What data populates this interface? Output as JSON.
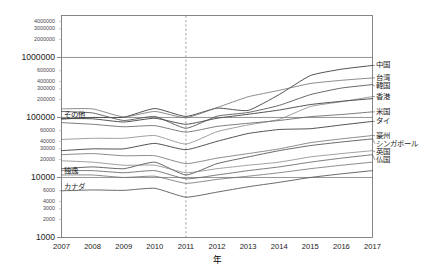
{
  "chart_data": {
    "type": "line",
    "title": "",
    "xlabel": "年",
    "ylabel": "",
    "yscale": "log",
    "ylim": [
      1000,
      5000000
    ],
    "grid": false,
    "legend_position": "right-inline-labels",
    "x": [
      2007,
      2008,
      2009,
      2010,
      2011,
      2012,
      2013,
      2014,
      2015,
      2016,
      2017
    ],
    "x_tick_labels": [
      "2007",
      "2008",
      "2009",
      "2010",
      "2011",
      "2012",
      "2013",
      "2014",
      "2015",
      "2016",
      "2017"
    ],
    "y_tick_labels": [
      "4000000",
      "3000000",
      "2000000",
      "1000000",
      "600000",
      "400000",
      "300000",
      "200000",
      "100000",
      "60000",
      "40000",
      "30000",
      "20000",
      "10000",
      "6000",
      "4000",
      "3000",
      "2000",
      "1000"
    ],
    "y_major_ticks": [
      "1000000",
      "100000",
      "10000",
      "1000"
    ],
    "annotations": [
      {
        "label": "2011",
        "type": "vertical-dashed-line",
        "x": 2011
      }
    ],
    "series": [
      {
        "name": "中国",
        "label_side": "right",
        "values": [
          94000,
          100000,
          101000,
          141000,
          104000,
          143000,
          131000,
          241000,
          499000,
          637000,
          736000
        ]
      },
      {
        "name": "台湾",
        "label_side": "right",
        "values": [
          139000,
          139000,
          102000,
          126000,
          99000,
          146000,
          221000,
          283000,
          368000,
          416000,
          456000
        ]
      },
      {
        "name": "韓国",
        "label_side": "right",
        "values": [
          126000,
          119000,
          89000,
          104000,
          66000,
          105000,
          121000,
          159000,
          240000,
          309000,
          353000
        ]
      },
      {
        "name": "香港",
        "label_side": "right",
        "values": [
          43000,
          45000,
          45000,
          50000,
          36000,
          58000,
          75000,
          93000,
          152000,
          183000,
          223000
        ]
      },
      {
        "name": "米国",
        "label_side": "right",
        "values": [
          82000,
          77000,
          70000,
          73000,
          57000,
          71000,
          80000,
          89000,
          103000,
          112000,
          124000
        ]
      },
      {
        "name": "タイ",
        "label_side": "right",
        "values": [
          28000,
          30000,
          30000,
          37000,
          29000,
          40000,
          54000,
          63000,
          65000,
          75000,
          86000
        ]
      },
      {
        "name": "豪州",
        "label_side": "right",
        "values": [
          24000,
          25000,
          23000,
          23000,
          17000,
          21000,
          25000,
          30000,
          38000,
          44000,
          50000
        ]
      },
      {
        "name": "シンガポール",
        "label_side": "right",
        "values": [
          14000,
          15000,
          14000,
          18000,
          11000,
          17000,
          22000,
          28000,
          34000,
          39000,
          44000
        ]
      },
      {
        "name": "英国",
        "label_side": "right",
        "values": [
          19000,
          18000,
          16000,
          16000,
          12000,
          14000,
          16000,
          18000,
          22000,
          25000,
          28000
        ]
      },
      {
        "name": "仏国",
        "label_side": "right",
        "values": [
          13000,
          13000,
          12000,
          13000,
          9500,
          11000,
          13000,
          15000,
          18000,
          21000,
          24000
        ]
      },
      {
        "name": "その他",
        "label_side": "left",
        "values": [
          96000,
          95000,
          84000,
          97000,
          77000,
          97000,
          113000,
          133000,
          164000,
          186000,
          206000
        ]
      },
      {
        "name": "独逸",
        "label_side": "left",
        "values": [
          11000,
          11000,
          10000,
          10500,
          8000,
          9300,
          10500,
          12000,
          14000,
          16000,
          18000
        ]
      },
      {
        "name": "カナダ",
        "label_side": "left",
        "values": [
          6000,
          6200,
          6100,
          6600,
          4700,
          5700,
          7000,
          8300,
          10000,
          11500,
          13000
        ]
      }
    ]
  },
  "axis": {
    "x_title": "年"
  }
}
